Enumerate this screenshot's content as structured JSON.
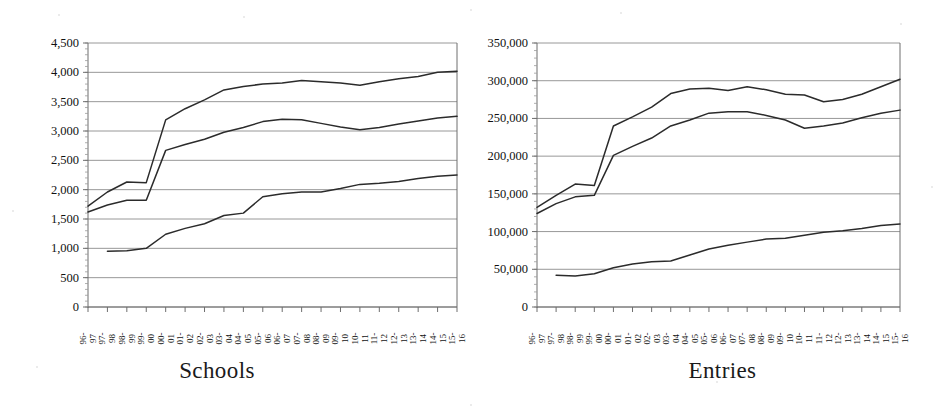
{
  "figure": {
    "background_color": "#ffffff",
    "line_color": "#2b2b2b",
    "grid_color": "#8c8c8c",
    "axis_color": "#6e6e6e",
    "panel_count": 2
  },
  "charts": [
    {
      "id": "schools",
      "title": "Schools",
      "plot": {
        "x": 88,
        "y": 43,
        "width": 369,
        "height": 264
      }
    },
    {
      "id": "entries",
      "title": "Entries",
      "plot": {
        "x": 67,
        "y": 43,
        "width": 363,
        "height": 264
      }
    }
  ],
  "chart_data": [
    {
      "type": "line",
      "title": "Schools",
      "xlabel": "",
      "ylabel": "",
      "ylim": [
        0,
        4500
      ],
      "ytick_step": 500,
      "ytick_labels": [
        "0",
        "500",
        "1,000",
        "1,500",
        "2,000",
        "2,500",
        "3,000",
        "3,500",
        "4,000",
        "4,500"
      ],
      "ytick_values": [
        0,
        500,
        1000,
        1500,
        2000,
        2500,
        3000,
        3500,
        4000,
        4500
      ],
      "grid": true,
      "legend": "none",
      "categories": [
        "96-97",
        "97-98",
        "98-99",
        "99-00",
        "00-01",
        "01-02",
        "02-03",
        "03-04",
        "04-05",
        "05-06",
        "06-07",
        "07-08",
        "08-09",
        "09-10",
        "10-11",
        "11-12",
        "12-13",
        "13-14",
        "14-15",
        "15-16"
      ],
      "category_lines": [
        [
          "96-",
          "97"
        ],
        [
          "97-",
          "98"
        ],
        [
          "98-",
          "99"
        ],
        [
          "99-",
          "00"
        ],
        [
          "00-",
          "01"
        ],
        [
          "01-",
          "02"
        ],
        [
          "02-",
          "03"
        ],
        [
          "03-",
          "04"
        ],
        [
          "04-",
          "05"
        ],
        [
          "05-",
          "06"
        ],
        [
          "06-",
          "07"
        ],
        [
          "07-",
          "08"
        ],
        [
          "08-",
          "09"
        ],
        [
          "09-",
          "10"
        ],
        [
          "10-",
          "11"
        ],
        [
          "11-",
          "12"
        ],
        [
          "12-",
          "13"
        ],
        [
          "13-",
          "14"
        ],
        [
          "14-",
          "15"
        ],
        [
          "15-",
          "16"
        ]
      ],
      "series": [
        {
          "name": "series-1-upper",
          "values": [
            1720,
            1960,
            2130,
            2120,
            3190,
            3380,
            3530,
            3700,
            3760,
            3800,
            3820,
            3860,
            3840,
            3820,
            3780,
            3840,
            3890,
            3930,
            4000,
            4020
          ]
        },
        {
          "name": "series-2-middle",
          "values": [
            1620,
            1740,
            1820,
            1820,
            2670,
            2770,
            2860,
            2980,
            3060,
            3160,
            3200,
            3190,
            3130,
            3070,
            3020,
            3060,
            3120,
            3170,
            3220,
            3250
          ]
        },
        {
          "name": "series-3-lower",
          "values": [
            null,
            950,
            960,
            1000,
            1240,
            1340,
            1420,
            1560,
            1600,
            1880,
            1930,
            1960,
            1960,
            2020,
            2090,
            2110,
            2140,
            2190,
            2230,
            2250
          ]
        }
      ]
    },
    {
      "type": "line",
      "title": "Entries",
      "xlabel": "",
      "ylabel": "",
      "ylim": [
        0,
        350000
      ],
      "ytick_step": 50000,
      "ytick_labels": [
        "0",
        "50,000",
        "100,000",
        "150,000",
        "200,000",
        "250,000",
        "300,000",
        "350,000"
      ],
      "ytick_values": [
        0,
        50000,
        100000,
        150000,
        200000,
        250000,
        300000,
        350000
      ],
      "grid": true,
      "legend": "none",
      "categories": [
        "96-97",
        "97-98",
        "98-99",
        "99-00",
        "00-01",
        "01-02",
        "02-03",
        "03-04",
        "04-05",
        "05-06",
        "06-07",
        "07-08",
        "08-09",
        "09-10",
        "10-11",
        "11-12",
        "12-13",
        "13-14",
        "14-15",
        "15-16"
      ],
      "category_lines": [
        [
          "96-",
          "97"
        ],
        [
          "97-",
          "98"
        ],
        [
          "98-",
          "99"
        ],
        [
          "99-",
          "00"
        ],
        [
          "00-",
          "01"
        ],
        [
          "01-",
          "02"
        ],
        [
          "02-",
          "03"
        ],
        [
          "03-",
          "04"
        ],
        [
          "04-",
          "05"
        ],
        [
          "05-",
          "06"
        ],
        [
          "06-",
          "07"
        ],
        [
          "07-",
          "08"
        ],
        [
          "08-",
          "09"
        ],
        [
          "09-",
          "10"
        ],
        [
          "10-",
          "11"
        ],
        [
          "11-",
          "12"
        ],
        [
          "12-",
          "13"
        ],
        [
          "13-",
          "14"
        ],
        [
          "14-",
          "15"
        ],
        [
          "15-",
          "16"
        ]
      ],
      "series": [
        {
          "name": "series-1-upper",
          "values": [
            132000,
            148000,
            163000,
            161000,
            240000,
            252000,
            265000,
            283000,
            289000,
            290000,
            287000,
            292000,
            288000,
            282000,
            281000,
            272000,
            275000,
            282000,
            292000,
            302000
          ]
        },
        {
          "name": "series-2-middle",
          "values": [
            124000,
            137000,
            146000,
            148000,
            201000,
            213000,
            224000,
            240000,
            248000,
            257000,
            259000,
            259000,
            254000,
            248000,
            237000,
            240000,
            244000,
            251000,
            257000,
            261000
          ]
        },
        {
          "name": "series-3-lower",
          "values": [
            null,
            42000,
            41000,
            44000,
            52000,
            57000,
            60000,
            61000,
            69000,
            77000,
            82000,
            86000,
            90000,
            91000,
            95000,
            99000,
            101000,
            104000,
            108000,
            110000
          ]
        }
      ]
    }
  ]
}
